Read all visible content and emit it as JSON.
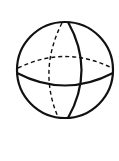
{
  "diagram": {
    "title": "",
    "shape": "sphere",
    "colors": {
      "stroke": "#111111",
      "background": "#ffffff"
    }
  }
}
